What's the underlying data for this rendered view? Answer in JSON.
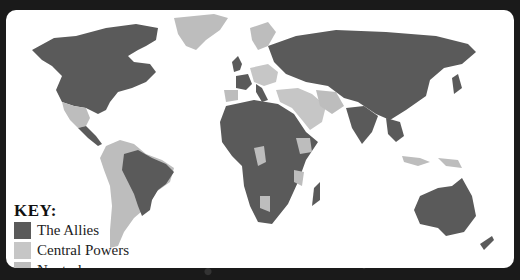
{
  "map": {
    "title": "World map of WWI alliances",
    "colors": {
      "allies": "#5a5a5a",
      "central_powers": "#c6c6c6",
      "neutral": "#bdbdbd",
      "ocean": "#ffffff",
      "background": "#1a1a1a"
    },
    "regions": {
      "allies": [
        "North America (US, Canada)",
        "Brazil",
        "Russia",
        "China",
        "India",
        "Australia",
        "most of Africa",
        "UK",
        "France",
        "Italy",
        "Japan"
      ],
      "central_powers": [
        "Germany",
        "Austria-Hungary",
        "Ottoman Empire"
      ],
      "neutral": [
        "Greenland",
        "Mexico",
        "most of South America",
        "Scandinavia",
        "Spain",
        "Persia",
        "Ethiopia"
      ]
    }
  },
  "key": {
    "title": "KEY:",
    "items": [
      {
        "label": "The Allies",
        "color": "#5a5a5a"
      },
      {
        "label": "Central Powers",
        "color": "#c6c6c6"
      },
      {
        "label": "Neutral",
        "color": "#bdbdbd"
      }
    ]
  }
}
